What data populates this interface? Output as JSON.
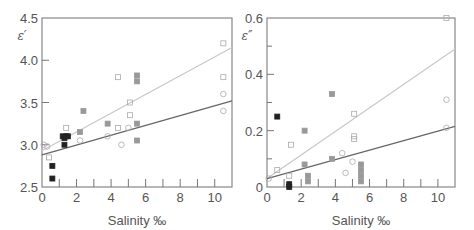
{
  "chart_data": [
    {
      "type": "scatter",
      "panel": "left",
      "ylabel": "ε′",
      "xlabel": "Salinity ‰",
      "xlim": [
        0,
        11
      ],
      "ylim": [
        2.5,
        4.5
      ],
      "x_ticks": [
        "0",
        "2",
        "4",
        "6",
        "8",
        "10"
      ],
      "y_ticks": [
        "2.5",
        "3.0",
        "3.5",
        "4.0",
        "4.5"
      ],
      "grid": false,
      "series": [
        {
          "name": "filled-black",
          "points": [
            [
              0.6,
              2.6
            ],
            [
              0.6,
              2.75
            ],
            [
              1.3,
              3.0
            ],
            [
              1.2,
              3.1
            ],
            [
              1.3,
              3.08
            ],
            [
              1.4,
              3.1
            ],
            [
              1.5,
              3.1
            ]
          ]
        },
        {
          "name": "grey-filled",
          "points": [
            [
              2.2,
              3.15
            ],
            [
              2.4,
              3.4
            ],
            [
              3.8,
              3.25
            ],
            [
              5.5,
              3.82
            ],
            [
              5.5,
              3.75
            ],
            [
              5.5,
              3.25
            ],
            [
              5.5,
              3.05
            ]
          ]
        },
        {
          "name": "open-squares",
          "points": [
            [
              0.4,
              2.85
            ],
            [
              1.4,
              3.2
            ],
            [
              4.4,
              3.8
            ],
            [
              5.1,
              3.5
            ],
            [
              5.1,
              3.35
            ],
            [
              4.4,
              3.2
            ],
            [
              10.5,
              4.2
            ],
            [
              10.5,
              3.8
            ]
          ]
        },
        {
          "name": "open-circles",
          "points": [
            [
              0.1,
              3.0
            ],
            [
              0.3,
              2.98
            ],
            [
              2.2,
              3.05
            ],
            [
              3.8,
              3.1
            ],
            [
              4.6,
              3.0
            ],
            [
              5.0,
              3.2
            ],
            [
              10.5,
              3.6
            ],
            [
              10.5,
              3.4
            ]
          ]
        }
      ],
      "fit_lines": [
        {
          "name": "upper-light",
          "color": "#c8c8c8",
          "from": [
            0,
            2.93
          ],
          "to": [
            11,
            4.15
          ]
        },
        {
          "name": "lower-dark",
          "color": "#666666",
          "from": [
            0,
            2.88
          ],
          "to": [
            11,
            3.52
          ]
        }
      ]
    },
    {
      "type": "scatter",
      "panel": "right",
      "ylabel": "ε″",
      "xlabel": "Salinity ‰",
      "xlim": [
        0,
        11
      ],
      "ylim": [
        0,
        0.6
      ],
      "x_ticks": [
        "0",
        "2",
        "4",
        "6",
        "8",
        "10"
      ],
      "y_ticks": [
        "0",
        "0.2",
        "0.4",
        "0.6"
      ],
      "grid": false,
      "series": [
        {
          "name": "filled-black",
          "points": [
            [
              0.6,
              0.25
            ],
            [
              1.3,
              0.01
            ],
            [
              1.3,
              0.0
            ]
          ]
        },
        {
          "name": "grey-filled",
          "points": [
            [
              2.2,
              0.2
            ],
            [
              2.2,
              0.08
            ],
            [
              2.4,
              0.04
            ],
            [
              2.4,
              0.02
            ],
            [
              3.8,
              0.33
            ],
            [
              3.8,
              0.1
            ],
            [
              5.5,
              0.08
            ],
            [
              5.5,
              0.06
            ],
            [
              5.5,
              0.04
            ],
            [
              5.5,
              0.02
            ]
          ]
        },
        {
          "name": "open-squares",
          "points": [
            [
              0.6,
              0.06
            ],
            [
              1.3,
              0.04
            ],
            [
              1.4,
              0.15
            ],
            [
              5.1,
              0.26
            ],
            [
              5.1,
              0.18
            ],
            [
              5.1,
              0.17
            ],
            [
              10.5,
              0.6
            ]
          ]
        },
        {
          "name": "open-circles",
          "points": [
            [
              0.1,
              0.03
            ],
            [
              4.4,
              0.12
            ],
            [
              4.6,
              0.05
            ],
            [
              5.0,
              0.09
            ],
            [
              10.5,
              0.31
            ],
            [
              10.5,
              0.21
            ]
          ]
        }
      ],
      "fit_lines": [
        {
          "name": "upper-light",
          "color": "#c8c8c8",
          "from": [
            0,
            0.03
          ],
          "to": [
            11,
            0.49
          ]
        },
        {
          "name": "lower-dark",
          "color": "#666666",
          "from": [
            0,
            0.03
          ],
          "to": [
            11,
            0.215
          ]
        }
      ]
    }
  ],
  "labels": {
    "left_ylabel": "ε′",
    "right_ylabel": "ε″",
    "xlabel": "Salinity ‰"
  }
}
